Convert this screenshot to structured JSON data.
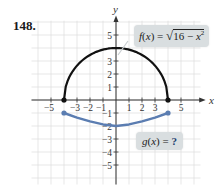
{
  "problem": {
    "number": "148."
  },
  "chart_data": {
    "type": "line",
    "title": "",
    "xlabel": "x",
    "ylabel": "y",
    "xlim": [
      -5.5,
      5.5
    ],
    "ylim": [
      -5.8,
      5.8
    ],
    "grid": true,
    "x_ticks": [
      -5,
      -3,
      -2,
      -1,
      1,
      2,
      3,
      5
    ],
    "y_ticks": [
      5,
      3,
      2,
      1,
      -1,
      -2,
      -3,
      -4,
      -5
    ],
    "series": [
      {
        "name": "f(x) = √(16 − x²)",
        "color": "#111111",
        "description": "upper semicircle of radius 4, endpoints (-4,0) and (4,0) filled",
        "x": [
          -4,
          -3,
          -2,
          -1,
          0,
          1,
          2,
          3,
          4
        ],
        "y": [
          0,
          2.65,
          3.46,
          3.87,
          4,
          3.87,
          3.46,
          2.65,
          0
        ]
      },
      {
        "name": "g(x) = ?",
        "color": "#5b7db1",
        "description": "shallow upward-opening curve, endpoints (-4,-1) and (4,-1) filled, minimum (0,-2)",
        "x": [
          -4,
          -3,
          -2,
          -1,
          0,
          1,
          2,
          3,
          4
        ],
        "y": [
          -1,
          -1.35,
          -1.65,
          -1.88,
          -2,
          -1.88,
          -1.65,
          -1.35,
          -1
        ]
      }
    ],
    "annotations": [
      {
        "text": "f(x) = √(16 − x²)",
        "position": "upper right"
      },
      {
        "text": "g(x) = ?",
        "position": "lower right"
      }
    ]
  },
  "labels": {
    "f": {
      "name": "f",
      "var": "x",
      "eq": " = ",
      "radical": "√",
      "radicand_a": "16 − ",
      "radicand_b": "x",
      "exp": "2"
    },
    "g": {
      "name": "g",
      "var": "x",
      "eq": " = ",
      "q": "?"
    }
  }
}
